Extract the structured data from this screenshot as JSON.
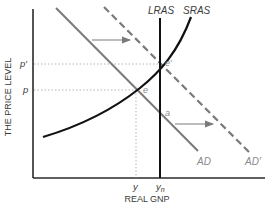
{
  "diagram": {
    "type": "AD-AS model",
    "y_axis_label": "THE PRICE LEVEL",
    "x_axis_label": "REAL GNP",
    "curves": {
      "lras": "LRAS",
      "sras": "SRAS",
      "ad": "AD",
      "ad_prime": "AD′"
    },
    "price_ticks": {
      "p_prime": "p′",
      "p": "p"
    },
    "output_ticks": {
      "y": "y",
      "yn_base": "y",
      "yn_sub": "n"
    },
    "points": {
      "e_prime": "e′",
      "e": "e",
      "a": "a"
    },
    "colors": {
      "axis": "#2a2a2a",
      "lras": "#111111",
      "sras": "#111111",
      "ad": "#7a7a7a",
      "ad_prime": "#7a7a7a",
      "guides": "#b5b5b5",
      "arrows": "#7a7a7a"
    }
  }
}
